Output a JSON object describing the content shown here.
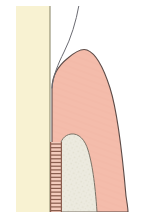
{
  "figure": {
    "width": 143,
    "height": 224,
    "background_color": "#ffffff"
  },
  "palette": {
    "background": "#ffffff",
    "enamel_cream": "#f8f2d2",
    "enamel_outline": "#8d8a6d",
    "gingiva_pink": "#f4bcab",
    "gingiva_outline": "#5d4b47",
    "root_pale": "#eceadf",
    "root_outline": "#7c7468",
    "ligament_fill": "#f3cbbc",
    "ligament_rung": "#8a5d4e",
    "probe_line": "#6b6b72"
  },
  "structures": [
    {
      "id": "enamel-strip",
      "label": "Enamel / tooth crown strip",
      "color": "#f8f2d2",
      "x": 16,
      "y": 6,
      "width": 34,
      "height": 206
    },
    {
      "id": "gingiva",
      "label": "Gingiva (gum tissue)",
      "color": "#f4bcab",
      "apex_x": 86,
      "apex_y": 50
    },
    {
      "id": "root",
      "label": "Tooth root / alveolar bone",
      "color": "#eceadf",
      "crest_x": 74,
      "crest_y": 134
    },
    {
      "id": "periodontal-ligament",
      "label": "Periodontal ligament (hatched band)",
      "color": "#f3cbbc",
      "x": 50,
      "y": 142,
      "width": 12,
      "height": 70,
      "rung_count": 19,
      "rung_color": "#8a5d4e"
    },
    {
      "id": "probe-line",
      "label": "Probe / sulcus guide line",
      "color": "#6b6b72"
    }
  ],
  "ligament_rungs": [
    144,
    147.7,
    151.4,
    155.1,
    158.8,
    162.5,
    166.2,
    169.9,
    173.6,
    177.3,
    181,
    184.7,
    188.4,
    192.1,
    195.8,
    199.5,
    203.2,
    206.9,
    210.6
  ]
}
